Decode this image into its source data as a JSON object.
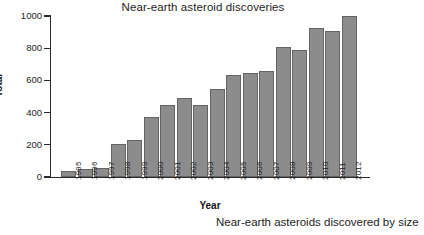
{
  "chart_data": {
    "type": "bar",
    "title": "Near-earth asteroid discoveries",
    "xlabel": "Year",
    "ylabel": "Total",
    "categories": [
      "1995",
      "1996",
      "1997",
      "1998",
      "1999",
      "2000",
      "2001",
      "2002",
      "2003",
      "2004",
      "2005",
      "2006",
      "2007",
      "2008",
      "2009",
      "2010",
      "2011",
      "2012"
    ],
    "values": [
      35,
      50,
      58,
      208,
      232,
      375,
      450,
      492,
      448,
      545,
      635,
      645,
      657,
      808,
      790,
      925,
      910,
      1000
    ],
    "ylim": [
      0,
      1000
    ],
    "yticks": [
      0,
      200,
      400,
      600,
      800,
      1000
    ],
    "ytick_labels": [
      "0",
      "200",
      "400",
      "600",
      "800",
      "1000"
    ],
    "grid": false,
    "legend": null,
    "bar_color": "#8c8c8c",
    "bar_edge_color": "#646464",
    "axis_color": "#2b2b2b"
  },
  "caption": {
    "text": "Near-earth asteroids discovered by size"
  }
}
